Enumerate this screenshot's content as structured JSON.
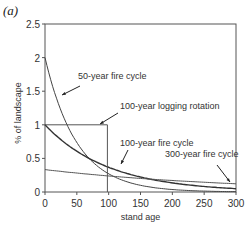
{
  "panel_label": "(a)",
  "chart_data": {
    "type": "line",
    "title": "",
    "xlabel": "stand age",
    "ylabel": "% of landscape",
    "xlim": [
      0,
      300
    ],
    "ylim": [
      0,
      2.5
    ],
    "x_ticks": [
      "0",
      "50",
      "100",
      "150",
      "200",
      "250",
      "300"
    ],
    "y_ticks": [
      "0",
      "0.5",
      "1",
      "1.5",
      "2",
      "2.5"
    ],
    "grid": false,
    "series": [
      {
        "name": "50-year fire cycle",
        "x": [
          0,
          25,
          50,
          75,
          100,
          150,
          200,
          250,
          300
        ],
        "y": [
          2.0,
          1.21,
          0.74,
          0.45,
          0.27,
          0.1,
          0.04,
          0.01,
          0.005
        ]
      },
      {
        "name": "100-year fire cycle",
        "x": [
          0,
          25,
          50,
          75,
          100,
          150,
          200,
          250,
          300
        ],
        "y": [
          1.0,
          0.78,
          0.61,
          0.47,
          0.37,
          0.22,
          0.14,
          0.08,
          0.05
        ]
      },
      {
        "name": "300-year fire cycle",
        "x": [
          0,
          100,
          200,
          300
        ],
        "y": [
          0.33,
          0.24,
          0.17,
          0.12
        ]
      },
      {
        "name": "100-year logging rotation",
        "x": [
          0,
          100,
          100,
          300
        ],
        "y": [
          1.0,
          1.0,
          0,
          0
        ]
      }
    ],
    "annotations": [
      "50-year fire cycle",
      "100-year logging rotation",
      "100-year fire cycle",
      "300-year fire cycle"
    ]
  }
}
